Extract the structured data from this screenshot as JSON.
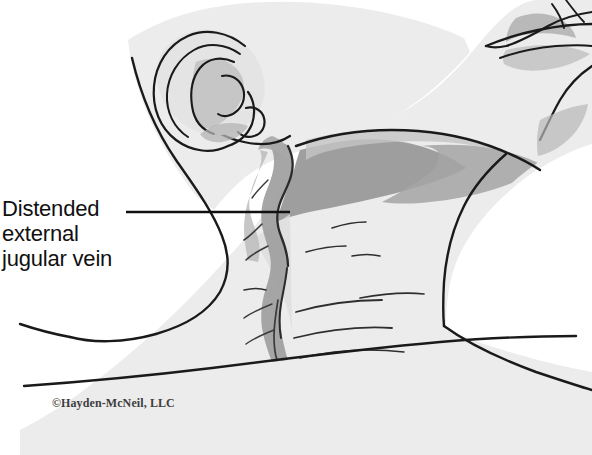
{
  "figure": {
    "kind": "anatomical-illustration",
    "background_color": "#ffffff",
    "skin_fill": "#ececec",
    "shadow_fill": "#9a9a9a",
    "vein_fill": "#9e9e9e",
    "vein_fill_light": "#b8b8b8",
    "outline_color": "#1a1a1a",
    "parts": [
      "ear",
      "lips",
      "chin",
      "jawline",
      "neck",
      "shoulder",
      "distended-external-jugular-vein",
      "submandibular-shadow",
      "neck-crease-lines"
    ]
  },
  "callout": {
    "line1": "Distended",
    "line2": "external",
    "line3": "jugular vein",
    "leader_color": "#101010",
    "leader_start_x": 126,
    "leader_end_x": 290,
    "leader_y": 212
  },
  "copyright": {
    "text": "©Hayden-McNeil, LLC"
  }
}
